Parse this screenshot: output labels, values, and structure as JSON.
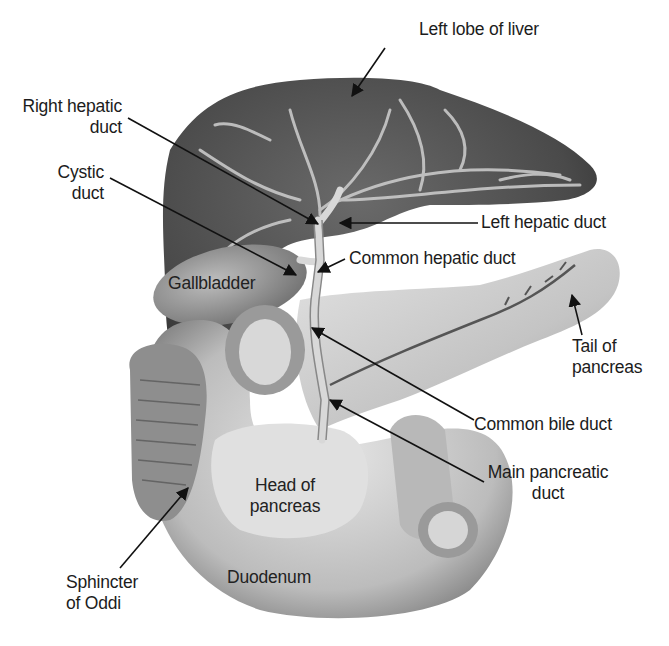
{
  "figure": {
    "colors": {
      "background": "#ffffff",
      "label_text": "#1c1c1c",
      "leader_line": "#111111",
      "liver": "#4a4a4a",
      "gallbladder": "#8a8a8a",
      "pancreas": "#c9c9c9",
      "duodenum": "#bdbdbd",
      "ducts": "#d8d8d8"
    }
  },
  "labels": {
    "left_lobe_of_liver": "Left lobe of liver",
    "right_hepatic_duct_1": "Right hepatic",
    "right_hepatic_duct_2": "duct",
    "cystic_duct_1": "Cystic",
    "cystic_duct_2": "duct",
    "left_hepatic_duct": "Left hepatic duct",
    "common_hepatic_duct": "Common hepatic duct",
    "gallbladder": "Gallbladder",
    "tail_of_pancreas_1": "Tail of",
    "tail_of_pancreas_2": "pancreas",
    "common_bile_duct": "Common bile duct",
    "main_pancreatic_duct_1": "Main pancreatic",
    "main_pancreatic_duct_2": "duct",
    "head_of_pancreas_1": "Head of",
    "head_of_pancreas_2": "pancreas",
    "sphincter_of_oddi_1": "Sphincter",
    "sphincter_of_oddi_2": "of Oddi",
    "duodenum": "Duodenum"
  }
}
